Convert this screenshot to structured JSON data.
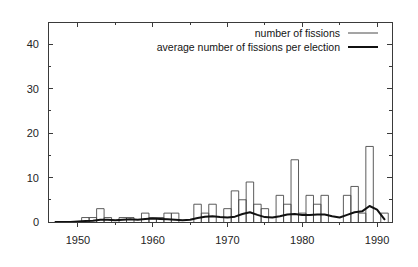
{
  "chart_data": {
    "type": "bar",
    "title": "",
    "xlabel": "",
    "ylabel": "",
    "xlim": [
      1946,
      1992
    ],
    "ylim": [
      0,
      45
    ],
    "grid": false,
    "legend_position": "top-right",
    "xticks": [
      1950,
      1960,
      1970,
      1980,
      1990
    ],
    "yticks": [
      0,
      10,
      20,
      30,
      40
    ],
    "x": [
      1947,
      1948,
      1949,
      1950,
      1951,
      1952,
      1953,
      1954,
      1955,
      1956,
      1957,
      1958,
      1959,
      1960,
      1961,
      1962,
      1963,
      1964,
      1965,
      1966,
      1967,
      1968,
      1969,
      1970,
      1971,
      1972,
      1973,
      1974,
      1975,
      1976,
      1977,
      1978,
      1979,
      1980,
      1981,
      1982,
      1983,
      1984,
      1985,
      1986,
      1987,
      1988,
      1989,
      1990,
      1991
    ],
    "series": [
      {
        "name": "number of fissions",
        "style": "bar",
        "values": [
          0,
          0,
          0,
          0,
          1,
          1,
          3,
          1,
          0,
          1,
          1,
          0,
          2,
          1,
          1,
          2,
          2,
          0,
          0,
          4,
          2,
          4,
          0,
          3,
          7,
          5,
          9,
          4,
          3,
          0,
          6,
          4,
          14,
          2,
          6,
          4,
          6,
          0,
          0,
          6,
          8,
          2,
          17,
          0,
          2
        ]
      },
      {
        "name": "average number of fissions per election",
        "style": "line",
        "values": [
          0,
          0,
          0,
          0.1,
          0.2,
          0.3,
          0.5,
          0.5,
          0.4,
          0.5,
          0.6,
          0.5,
          0.7,
          0.8,
          0.7,
          0.6,
          0.5,
          0.4,
          0.5,
          0.9,
          1.2,
          1.3,
          1.1,
          1.0,
          1.2,
          1.8,
          2.2,
          1.6,
          1.1,
          1.0,
          1.3,
          1.7,
          1.8,
          1.6,
          1.6,
          1.7,
          1.7,
          1.3,
          1.0,
          1.6,
          2.2,
          2.4,
          3.6,
          2.8,
          0.6
        ]
      }
    ]
  },
  "legend": {
    "entries": [
      {
        "label": "number of fissions",
        "marker": "thin-line"
      },
      {
        "label": "average number of fissions per election",
        "marker": "thick-line"
      }
    ]
  },
  "axes": {
    "y_tick_labels": [
      "0",
      "10",
      "20",
      "30",
      "40"
    ],
    "x_tick_labels": [
      "1950",
      "1960",
      "1970",
      "1980",
      "1990"
    ]
  },
  "colors": {
    "background": "#ffffff",
    "axis": "#3a3a3a",
    "bar_stroke": "#4a4a4a",
    "line_stroke": "#111111",
    "text": "#242424"
  }
}
